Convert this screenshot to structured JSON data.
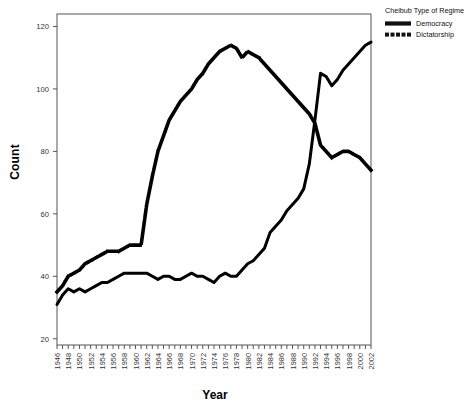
{
  "chart_data": {
    "type": "line",
    "title": "",
    "xlabel": "Year",
    "ylabel": "Count",
    "xlim": [
      1946,
      2002
    ],
    "ylim": [
      18,
      124
    ],
    "yticks": [
      20,
      40,
      60,
      80,
      100,
      120
    ],
    "xticks": [
      1946,
      1947,
      1948,
      1949,
      1950,
      1951,
      1952,
      1953,
      1954,
      1955,
      1956,
      1957,
      1958,
      1959,
      1960,
      1961,
      1962,
      1963,
      1964,
      1965,
      1966,
      1967,
      1968,
      1969,
      1970,
      1971,
      1972,
      1973,
      1974,
      1975,
      1976,
      1977,
      1978,
      1979,
      1980,
      1981,
      1982,
      1983,
      1984,
      1985,
      1986,
      1987,
      1988,
      1989,
      1990,
      1991,
      1992,
      1993,
      1994,
      1995,
      1996,
      1997,
      1998,
      1999,
      2000,
      2001,
      2002
    ],
    "xtick_labels": [
      "1946",
      "1948",
      "1950",
      "1952",
      "1954",
      "1956",
      "1958",
      "1960",
      "1962",
      "1964",
      "1966",
      "1968",
      "1970",
      "1972",
      "1974",
      "1976",
      "1978",
      "1980",
      "1982",
      "1984",
      "1986",
      "1988",
      "1990",
      "1992",
      "1994",
      "1996",
      "1998",
      "2000",
      "2002"
    ],
    "xtick_label_years": [
      1946,
      1948,
      1950,
      1952,
      1954,
      1956,
      1958,
      1960,
      1962,
      1964,
      1966,
      1968,
      1970,
      1972,
      1974,
      1976,
      1978,
      1980,
      1982,
      1984,
      1986,
      1988,
      1990,
      1992,
      1994,
      1996,
      1998,
      2000,
      2002
    ],
    "grid": false,
    "legend_position": "right-top",
    "x": [
      1946,
      1947,
      1948,
      1949,
      1950,
      1951,
      1952,
      1953,
      1954,
      1955,
      1956,
      1957,
      1958,
      1959,
      1960,
      1961,
      1962,
      1963,
      1964,
      1965,
      1966,
      1967,
      1968,
      1969,
      1970,
      1971,
      1972,
      1973,
      1974,
      1975,
      1976,
      1977,
      1978,
      1979,
      1980,
      1981,
      1982,
      1983,
      1984,
      1985,
      1986,
      1987,
      1988,
      1989,
      1990,
      1991,
      1992,
      1993,
      1994,
      1995,
      1996,
      1997,
      1998,
      1999,
      2000,
      2001,
      2002
    ],
    "series": [
      {
        "name": "Democracy",
        "style": "solid",
        "color": "#000000",
        "values": [
          31,
          34,
          36,
          35,
          36,
          35,
          36,
          37,
          38,
          38,
          39,
          40,
          41,
          41,
          41,
          41,
          41,
          40,
          39,
          40,
          40,
          39,
          39,
          40,
          41,
          40,
          40,
          39,
          38,
          40,
          41,
          40,
          40,
          42,
          44,
          45,
          47,
          49,
          54,
          56,
          58,
          61,
          63,
          65,
          68,
          76,
          90,
          105,
          104,
          101,
          103,
          106,
          108,
          110,
          112,
          114,
          115
        ]
      },
      {
        "name": "Dictatorship",
        "style": "dotted",
        "color": "#000000",
        "values": [
          35,
          37,
          40,
          41,
          42,
          44,
          45,
          46,
          47,
          48,
          48,
          48,
          49,
          50,
          50,
          50,
          63,
          72,
          80,
          85,
          90,
          93,
          96,
          98,
          100,
          103,
          105,
          108,
          110,
          112,
          113,
          114,
          113,
          110,
          112,
          111,
          110,
          108,
          106,
          104,
          102,
          100,
          98,
          96,
          94,
          92,
          89,
          82,
          80,
          78,
          79,
          80,
          80,
          79,
          78,
          76,
          74
        ]
      }
    ],
    "legend": {
      "title": "Cheibub Type of Regime",
      "entries": [
        {
          "label": "Democracy",
          "style": "solid"
        },
        {
          "label": "Dictatorship",
          "style": "dotted"
        }
      ]
    }
  }
}
